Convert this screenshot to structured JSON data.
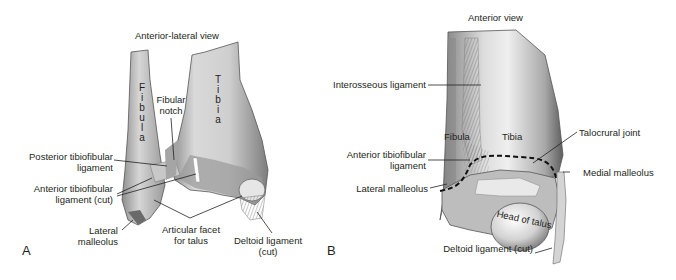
{
  "figure": {
    "panels": [
      {
        "letter": "A",
        "title": "Anterior-lateral view",
        "bones": {
          "fibula": "F i b u l a",
          "tibia": "T i b i a"
        },
        "labels": {
          "fibular_notch_1": "Fibular",
          "fibular_notch_2": "notch",
          "posterior_tib_1": "Posterior tibiofibular",
          "posterior_tib_2": "ligament",
          "anterior_tib_1": "Anterior tibiofibular",
          "anterior_tib_2": "ligament (cut)",
          "lateral_mall_1": "Lateral",
          "lateral_mall_2": "malleolus",
          "artic_facet_1": "Articular facet",
          "artic_facet_2": "for talus",
          "deltoid_1": "Deltoid ligament",
          "deltoid_2": "(cut)"
        },
        "fibula_letters": [
          "F",
          "i",
          "b",
          "u",
          "l",
          "a"
        ],
        "tibia_letters": [
          "T",
          "i",
          "b",
          "i",
          "a"
        ]
      },
      {
        "letter": "B",
        "title": "Anterior view",
        "labels": {
          "interosseous": "Interosseous ligament",
          "fibula": "Fibula",
          "tibia": "Tibia",
          "anterior_tib_1": "Anterior tibiofibular",
          "anterior_tib_2": "ligament",
          "lateral_mall": "Lateral malleolus",
          "talocrural": "Talocrural joint",
          "medial_mall": "Medial malleolus",
          "head_talus": "Head of talus",
          "deltoid": "Deltoid ligament (cut)"
        }
      }
    ]
  },
  "colors": {
    "bone_light": "#e6e6e6",
    "bone_mid": "#b5b5b5",
    "bone_dark": "#6e6e6e",
    "line": "#231f20"
  }
}
